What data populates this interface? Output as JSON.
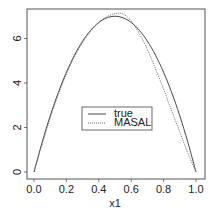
{
  "chart_data": {
    "type": "line",
    "title": "",
    "xlabel": "x1",
    "ylabel": "",
    "xlim": [
      0.0,
      1.0
    ],
    "ylim": [
      -0.3,
      7.4
    ],
    "grid": false,
    "legend_position": "center",
    "x_ticks": [
      "0.0",
      "0.2",
      "0.4",
      "0.6",
      "0.8",
      "1.0"
    ],
    "y_ticks": [
      "0",
      "2",
      "4",
      "6"
    ],
    "x": [
      0.0,
      0.05,
      0.1,
      0.15,
      0.2,
      0.25,
      0.3,
      0.35,
      0.4,
      0.45,
      0.5,
      0.55,
      0.6,
      0.65,
      0.7,
      0.75,
      0.8,
      0.85,
      0.9,
      0.95,
      1.0
    ],
    "series": [
      {
        "name": "true",
        "style": "solid",
        "values": [
          0.0,
          1.33,
          2.52,
          3.57,
          4.48,
          5.25,
          5.88,
          6.37,
          6.72,
          6.93,
          7.0,
          6.93,
          6.72,
          6.37,
          5.88,
          5.25,
          4.48,
          3.57,
          2.52,
          1.33,
          0.0
        ]
      },
      {
        "name": "MASAL",
        "style": "dotted",
        "values": [
          0.0,
          1.25,
          2.42,
          3.48,
          4.4,
          5.18,
          5.82,
          6.33,
          6.72,
          6.98,
          7.12,
          7.1,
          6.78,
          6.22,
          5.5,
          4.65,
          3.72,
          2.75,
          1.8,
          0.85,
          0.0
        ]
      }
    ]
  },
  "legend": {
    "items": [
      {
        "label": "true"
      },
      {
        "label": "MASAL"
      }
    ]
  },
  "axes": {
    "xlabel": "x1"
  }
}
